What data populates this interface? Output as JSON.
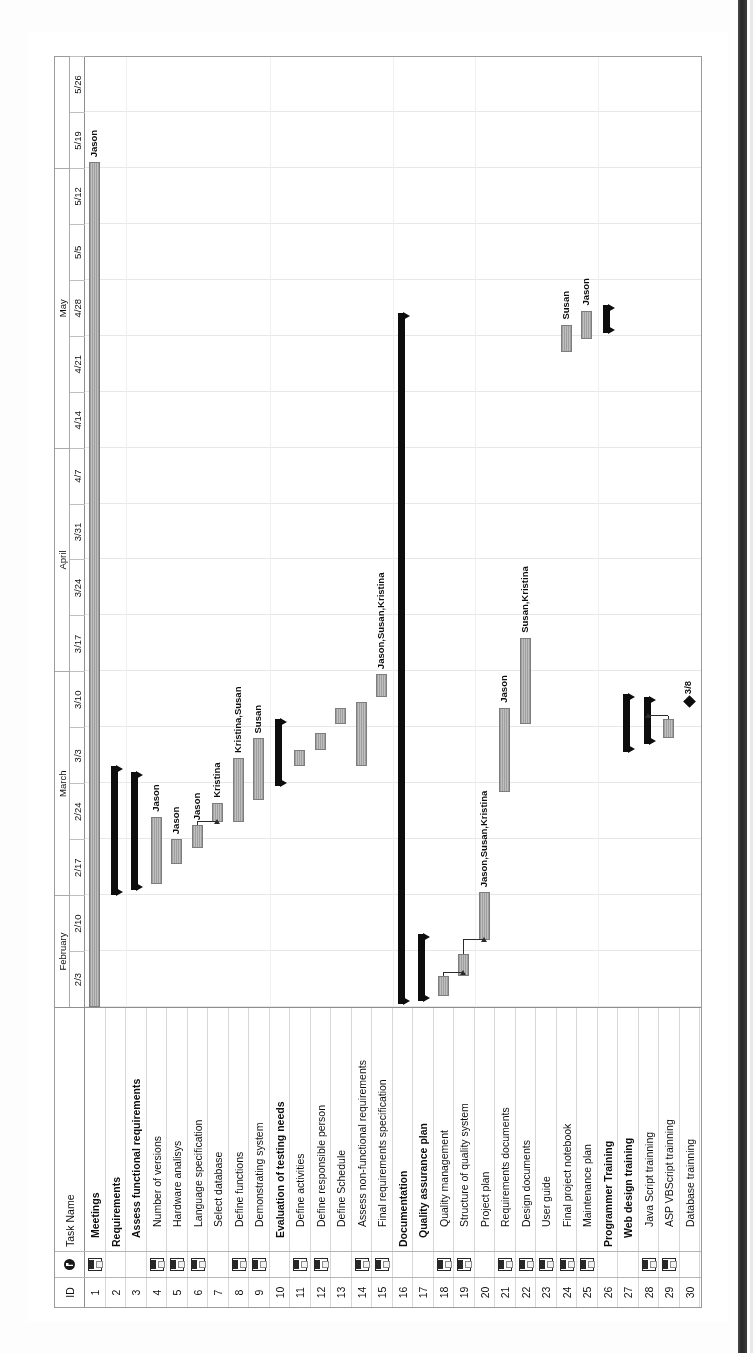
{
  "document": {
    "kind": "microsoft-project-gantt-chart",
    "orientation": "rotated-90-ccw-scan"
  },
  "table": {
    "headers": {
      "id": "ID",
      "indicator": "indicator-icon",
      "task_name": "Task Name"
    }
  },
  "timescale": {
    "months": [
      {
        "label": "February",
        "span": 2
      },
      {
        "label": "March",
        "span": 4
      },
      {
        "label": "April",
        "span": 4
      },
      {
        "label": "May",
        "span": 5
      }
    ],
    "weeks": [
      "2/3",
      "2/10",
      "2/17",
      "2/24",
      "3/3",
      "3/10",
      "3/17",
      "3/24",
      "3/31",
      "4/7",
      "4/14",
      "4/21",
      "4/28",
      "5/5",
      "5/12",
      "5/19",
      "5/26"
    ]
  },
  "rows": [
    {
      "id": "1",
      "name": "Meetings",
      "level": 2,
      "bold": false,
      "indicator": true
    },
    {
      "id": "2",
      "name": "Requirements",
      "level": 1,
      "bold": true,
      "indicator": false
    },
    {
      "id": "3",
      "name": "Assess functional requirements",
      "level": 2,
      "bold": true,
      "indicator": false
    },
    {
      "id": "4",
      "name": "Number of versions",
      "level": 3,
      "bold": false,
      "indicator": true
    },
    {
      "id": "5",
      "name": "Hardware analisys",
      "level": 3,
      "bold": false,
      "indicator": true
    },
    {
      "id": "6",
      "name": "Language specification",
      "level": 3,
      "bold": false,
      "indicator": true
    },
    {
      "id": "7",
      "name": "Select database",
      "level": 3,
      "bold": false,
      "indicator": false
    },
    {
      "id": "8",
      "name": "Define functions",
      "level": 3,
      "bold": false,
      "indicator": true
    },
    {
      "id": "9",
      "name": "Demonstrating system",
      "level": 3,
      "bold": false,
      "indicator": true
    },
    {
      "id": "10",
      "name": "Evaluation of testing needs",
      "level": 2,
      "bold": true,
      "indicator": false
    },
    {
      "id": "11",
      "name": "Define activities",
      "level": 3,
      "bold": false,
      "indicator": true
    },
    {
      "id": "12",
      "name": "Define responsible person",
      "level": 3,
      "bold": false,
      "indicator": true
    },
    {
      "id": "13",
      "name": "Define Schedule",
      "level": 3,
      "bold": false,
      "indicator": false
    },
    {
      "id": "14",
      "name": "Assess non-functional requirements",
      "level": 3,
      "bold": false,
      "indicator": true
    },
    {
      "id": "15",
      "name": "Final requirements specification",
      "level": 3,
      "bold": false,
      "indicator": true
    },
    {
      "id": "16",
      "name": "Documentation",
      "level": 1,
      "bold": true,
      "indicator": false
    },
    {
      "id": "17",
      "name": "Quality assurance plan",
      "level": 2,
      "bold": true,
      "indicator": false
    },
    {
      "id": "18",
      "name": "Quality management",
      "level": 3,
      "bold": false,
      "indicator": true
    },
    {
      "id": "19",
      "name": "Structure of quality system",
      "level": 3,
      "bold": false,
      "indicator": true
    },
    {
      "id": "20",
      "name": "Project plan",
      "level": 3,
      "bold": false,
      "indicator": false
    },
    {
      "id": "21",
      "name": "Requirements documents",
      "level": 3,
      "bold": false,
      "indicator": true
    },
    {
      "id": "22",
      "name": "Design documents",
      "level": 3,
      "bold": false,
      "indicator": true
    },
    {
      "id": "23",
      "name": "User guide",
      "level": 3,
      "bold": false,
      "indicator": true
    },
    {
      "id": "24",
      "name": "Final project notebook",
      "level": 3,
      "bold": false,
      "indicator": true
    },
    {
      "id": "25",
      "name": "Maintenance plan",
      "level": 3,
      "bold": false,
      "indicator": true
    },
    {
      "id": "26",
      "name": "Programmer Training",
      "level": 1,
      "bold": true,
      "indicator": false
    },
    {
      "id": "27",
      "name": "Web design training",
      "level": 2,
      "bold": true,
      "indicator": false
    },
    {
      "id": "28",
      "name": "Java Script trainning",
      "level": 3,
      "bold": false,
      "indicator": true
    },
    {
      "id": "29",
      "name": "ASP VBScript trainning",
      "level": 3,
      "bold": false,
      "indicator": true
    },
    {
      "id": "30",
      "name": "Database trainning",
      "level": 3,
      "bold": false,
      "indicator": false
    }
  ],
  "chart_data": {
    "type": "gantt",
    "xlabel": "",
    "ylabel": "Task Name",
    "axis_start": "2/3",
    "axis_end": "5/26",
    "week_labels": [
      "2/3",
      "2/10",
      "2/17",
      "2/24",
      "3/3",
      "3/10",
      "3/17",
      "3/24",
      "3/31",
      "4/7",
      "4/14",
      "4/21",
      "4/28",
      "5/5",
      "5/12",
      "5/19",
      "5/26"
    ],
    "tasks": [
      {
        "id": "1",
        "name": "Meetings",
        "kind": "task",
        "start_wk": 0.0,
        "end_wk": 15.1,
        "resource": "Jason"
      },
      {
        "id": "2",
        "name": "Requirements",
        "kind": "summary",
        "start_wk": 2.0,
        "end_wk": 4.3,
        "resource": ""
      },
      {
        "id": "3",
        "name": "Assess functional requirements",
        "kind": "summary",
        "start_wk": 2.1,
        "end_wk": 4.2,
        "resource": ""
      },
      {
        "id": "4",
        "name": "Number of versions",
        "kind": "task",
        "start_wk": 2.2,
        "end_wk": 3.4,
        "resource": "Jason"
      },
      {
        "id": "5",
        "name": "Hardware analisys",
        "kind": "task",
        "start_wk": 2.55,
        "end_wk": 3.0,
        "resource": "Jason"
      },
      {
        "id": "6",
        "name": "Language specification",
        "kind": "task",
        "start_wk": 2.85,
        "end_wk": 3.25,
        "resource": "Jason"
      },
      {
        "id": "7",
        "name": "Select database",
        "kind": "task",
        "start_wk": 3.3,
        "end_wk": 3.65,
        "resource": "Kristina"
      },
      {
        "id": "8",
        "name": "Define functions",
        "kind": "task",
        "start_wk": 3.3,
        "end_wk": 4.45,
        "resource": "Kristina,Susan"
      },
      {
        "id": "9",
        "name": "Demonstrating system",
        "kind": "task",
        "start_wk": 3.7,
        "end_wk": 4.8,
        "resource": "Susan"
      },
      {
        "id": "10",
        "name": "Evaluation of testing needs",
        "kind": "summary",
        "start_wk": 3.95,
        "end_wk": 5.15,
        "resource": ""
      },
      {
        "id": "11",
        "name": "Define activities",
        "kind": "task",
        "start_wk": 4.3,
        "end_wk": 4.6,
        "resource": ""
      },
      {
        "id": "12",
        "name": "Define responsible person",
        "kind": "task",
        "start_wk": 4.6,
        "end_wk": 4.9,
        "resource": ""
      },
      {
        "id": "13",
        "name": "Define Schedule",
        "kind": "task",
        "start_wk": 5.05,
        "end_wk": 5.35,
        "resource": ""
      },
      {
        "id": "14",
        "name": "Assess non-functional requirements",
        "kind": "task",
        "start_wk": 4.3,
        "end_wk": 5.45,
        "resource": ""
      },
      {
        "id": "15",
        "name": "Final requirements specification",
        "kind": "task",
        "start_wk": 5.55,
        "end_wk": 5.95,
        "resource": "Jason,Susan,Kristina"
      },
      {
        "id": "16",
        "name": "Documentation",
        "kind": "summary",
        "start_wk": 0.05,
        "end_wk": 12.4,
        "resource": ""
      },
      {
        "id": "17",
        "name": "Quality assurance plan",
        "kind": "summary",
        "start_wk": 0.1,
        "end_wk": 1.3,
        "resource": ""
      },
      {
        "id": "18",
        "name": "Quality management",
        "kind": "task",
        "start_wk": 0.2,
        "end_wk": 0.55,
        "resource": ""
      },
      {
        "id": "19",
        "name": "Structure of quality system",
        "kind": "task",
        "start_wk": 0.55,
        "end_wk": 0.95,
        "resource": ""
      },
      {
        "id": "20",
        "name": "Project plan",
        "kind": "task",
        "start_wk": 1.2,
        "end_wk": 2.05,
        "resource": "Jason,Susan,Kristina"
      },
      {
        "id": "21",
        "name": "Requirements documents",
        "kind": "task",
        "start_wk": 3.85,
        "end_wk": 5.35,
        "resource": "Jason"
      },
      {
        "id": "22",
        "name": "Design documents",
        "kind": "task",
        "start_wk": 5.05,
        "end_wk": 6.6,
        "resource": "Susan,Kristina"
      },
      {
        "id": "23",
        "name": "User guide",
        "kind": "none",
        "start_wk": 0,
        "end_wk": 0,
        "resource": ""
      },
      {
        "id": "24",
        "name": "Final project notebook",
        "kind": "task",
        "start_wk": 11.7,
        "end_wk": 12.2,
        "resource": "Susan"
      },
      {
        "id": "25",
        "name": "Maintenance plan",
        "kind": "task",
        "start_wk": 11.95,
        "end_wk": 12.45,
        "resource": "Jason"
      },
      {
        "id": "26",
        "name": "Programmer Training",
        "kind": "summary",
        "start_wk": 12.05,
        "end_wk": 12.55,
        "resource": ""
      },
      {
        "id": "27",
        "name": "Web design training",
        "kind": "summary",
        "start_wk": 4.55,
        "end_wk": 5.6,
        "resource": ""
      },
      {
        "id": "28",
        "name": "Java Script trainning",
        "kind": "summary",
        "start_wk": 4.7,
        "end_wk": 5.55,
        "resource": ""
      },
      {
        "id": "29",
        "name": "ASP VBScript trainning",
        "kind": "task",
        "start_wk": 4.8,
        "end_wk": 5.15,
        "resource": ""
      },
      {
        "id": "30",
        "name": "Database trainning",
        "kind": "milestone",
        "start_wk": 5.45,
        "end_wk": 5.45,
        "resource": "",
        "milestone_label": "3/8"
      }
    ],
    "resource_labels": [
      "Jason",
      "Jason",
      "Jason",
      "Kristina",
      "Kristina,Susan",
      "Susan",
      "Jason,Susan,Kristina",
      "Jason,Susan,Kristina",
      "Jason",
      "Susan,Kristina",
      "Susan",
      "Jason",
      "Jason"
    ],
    "legend": [],
    "grid": true
  },
  "colors": {
    "bar_fill": "#b0b0b0",
    "bar_border": "#7d7d7d",
    "summary_bar": "#111111",
    "milestone": "#111111",
    "grid_line": "#e3e3e3",
    "frame": "#9a9a9a",
    "paper": "#ffffff"
  }
}
